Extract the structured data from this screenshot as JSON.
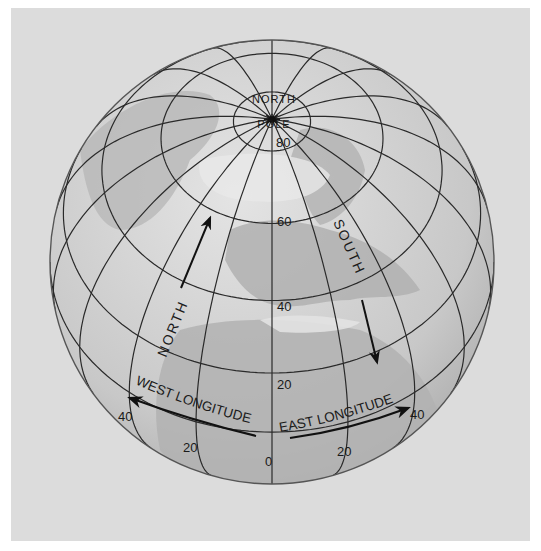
{
  "figure": {
    "type": "globe-latitude-longitude-diagram",
    "background_color": "#dcdcdc",
    "ocean_color": "#c9c9c9",
    "land_color": "#b4b4b4",
    "light_land_color": "#e6e6e6",
    "grid_color": "#2a2a2a",
    "pole_label_top": "NORTH",
    "pole_label_bottom": "POLE",
    "direction_labels": {
      "north": "NORTH",
      "south": "SOUTH",
      "west_longitude": "WEST LONGITUDE",
      "east_longitude": "EAST LONGITUDE"
    },
    "latitude_labels": [
      "80",
      "60",
      "40",
      "20"
    ],
    "longitude_labels": {
      "prime": "0",
      "west_20": "20",
      "west_40": "40",
      "east_20": "20",
      "east_40": "40"
    }
  },
  "projection": {
    "cx": 272,
    "cy": 262,
    "r": 222,
    "tilt_deg": 50,
    "latitudes": [
      0,
      20,
      40,
      60,
      80
    ],
    "longitude_step_deg": 20
  }
}
